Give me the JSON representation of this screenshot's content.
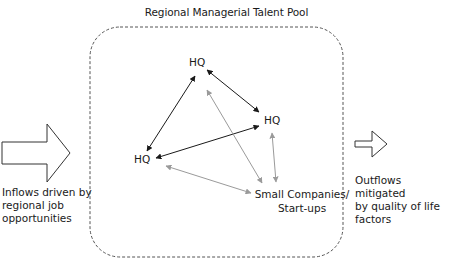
{
  "title": "Regional Managerial Talent Pool",
  "nodes": {
    "hq_top": "HQ",
    "hq_right": "HQ",
    "hq_left": "HQ",
    "small_line1": "Small Companies/",
    "small_line2": "Start-ups"
  },
  "inflow": {
    "line1": "Inflows driven by",
    "line2": "regional job",
    "line3": "opportunities"
  },
  "outflow": {
    "line1": "Outflows mitigated",
    "line2": "by quality of life",
    "line3": "factors"
  },
  "colors": {
    "dark_arrow": "#1a1a1a",
    "light_arrow": "#9a9a9a",
    "border": "#555555"
  }
}
